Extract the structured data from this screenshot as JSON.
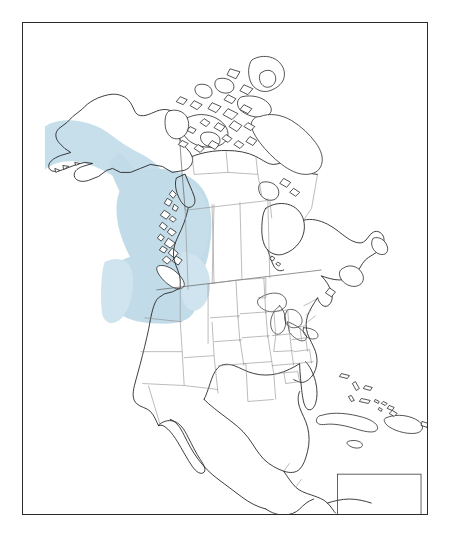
{
  "figure": {
    "type": "species-range-map",
    "region": "North America",
    "title": "",
    "caption": "",
    "background_color": "#ffffff",
    "frame": {
      "color": "#2b2b2b",
      "width_px": 1.6,
      "x": 22,
      "y": 22,
      "w": 406,
      "h": 493
    }
  },
  "legend": {
    "entries": [
      {
        "label": "",
        "color": "#c2dbe8",
        "meaning": "range"
      }
    ],
    "visible": false
  },
  "colors": {
    "range_fill": "#c2dbe8",
    "range_fill_soft": "#cfe4ee",
    "coastline": "#1b1b1b",
    "subdivision_border": "#8e8e8e",
    "land_fill": "#ffffff",
    "frame": "#2b2b2b"
  },
  "map": {
    "projection_hint": "conic",
    "features": {
      "countries": [
        "Canada",
        "United States",
        "Mexico",
        "Guatemala",
        "Belize",
        "Honduras",
        "Nicaragua",
        "Costa Rica",
        "Panama",
        "Cuba",
        "Jamaica",
        "Haiti",
        "Dominican Republic",
        "Bahamas"
      ],
      "water_bodies": [
        "Hudson Bay",
        "Gulf of Mexico",
        "Great Lakes",
        "Gulf of California",
        "Caribbean Sea"
      ],
      "shows_greenland": false,
      "shows_state_borders": true,
      "shows_province_borders": true
    },
    "range_regions": [
      "Southern coastal Alaska",
      "Alaska Panhandle",
      "British Columbia",
      "Western Alberta",
      "Washington",
      "Oregon",
      "Idaho",
      "Western Montana"
    ]
  },
  "inset": {
    "present": true,
    "description": "rectangular clip box at lower right over northern South America"
  }
}
